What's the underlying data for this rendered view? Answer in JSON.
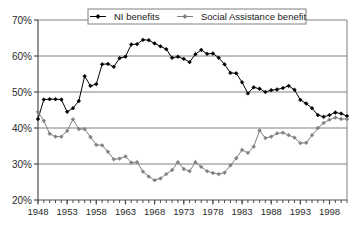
{
  "chart_data": {
    "type": "line",
    "title": "",
    "subtitle": "",
    "xlabel": "",
    "ylabel": "",
    "xlim": [
      1948,
      2001
    ],
    "ylim": [
      20,
      70
    ],
    "y_tick_labels": [
      "20%",
      "30%",
      "40%",
      "50%",
      "60%",
      "70%"
    ],
    "y_ticks": [
      20,
      30,
      40,
      50,
      60,
      70
    ],
    "x_tick_labels": [
      "1948",
      "1953",
      "1958",
      "1963",
      "1968",
      "1973",
      "1978",
      "1983",
      "1988",
      "1993",
      "1998"
    ],
    "x_ticks": [
      1948,
      1953,
      1958,
      1963,
      1968,
      1973,
      1978,
      1983,
      1988,
      1993,
      1998
    ],
    "x_minor_step": 1,
    "grid": "horizontal",
    "legend_position": "top-center",
    "marker": "diamond",
    "x": [
      1948,
      1949,
      1950,
      1951,
      1952,
      1953,
      1954,
      1955,
      1956,
      1957,
      1958,
      1959,
      1960,
      1961,
      1962,
      1963,
      1964,
      1965,
      1966,
      1967,
      1968,
      1969,
      1970,
      1971,
      1972,
      1973,
      1974,
      1975,
      1976,
      1977,
      1978,
      1979,
      1980,
      1981,
      1982,
      1983,
      1984,
      1985,
      1986,
      1987,
      1988,
      1989,
      1990,
      1991,
      1992,
      1993,
      1994,
      1995,
      1996,
      1997,
      1998,
      1999,
      2000,
      2001
    ],
    "series": [
      {
        "name": "NI benefits",
        "color": "#000000",
        "values": [
          42.5,
          47.9,
          48.0,
          48.0,
          47.9,
          44.5,
          45.5,
          47.5,
          54.4,
          51.7,
          52.2,
          57.7,
          57.8,
          57.0,
          59.4,
          59.8,
          63.2,
          63.3,
          64.5,
          64.4,
          63.5,
          62.7,
          61.9,
          59.5,
          59.8,
          59.2,
          58.3,
          60.5,
          61.7,
          60.6,
          60.7,
          59.5,
          57.7,
          55.3,
          55.2,
          52.7,
          49.6,
          51.3,
          50.9,
          50.0,
          50.5,
          50.7,
          51.1,
          51.7,
          50.6,
          47.8,
          46.8,
          45.5,
          43.6,
          43.1,
          43.6,
          44.3,
          44.0,
          43.3
        ]
      },
      {
        "name": "Social Assistance benefit",
        "color": "#808080",
        "values": [
          44.5,
          42.0,
          38.4,
          37.6,
          37.6,
          39.2,
          42.4,
          39.7,
          39.7,
          37.5,
          35.3,
          35.2,
          33.4,
          31.3,
          31.5,
          32.1,
          30.4,
          30.5,
          27.9,
          26.5,
          25.5,
          26.0,
          27.2,
          28.3,
          30.5,
          28.6,
          28.0,
          30.5,
          29.2,
          28.0,
          27.5,
          27.2,
          27.6,
          29.6,
          31.6,
          33.9,
          33.1,
          34.8,
          39.3,
          37.2,
          37.6,
          38.5,
          38.7,
          38.0,
          37.3,
          35.8,
          35.9,
          38.0,
          40.0,
          41.4,
          42.3,
          42.9,
          42.5,
          42.5
        ]
      }
    ]
  },
  "legend": {
    "items": [
      {
        "label": "NI benefits",
        "color": "#000000"
      },
      {
        "label": "Social Assistance benefit",
        "color": "#808080"
      }
    ]
  }
}
